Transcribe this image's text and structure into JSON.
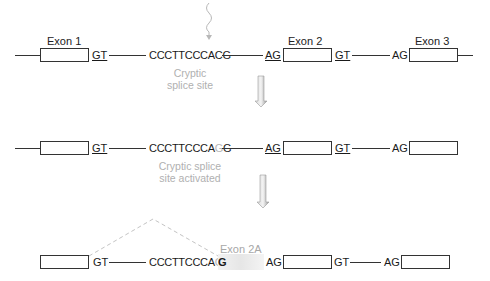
{
  "row1": {
    "exon_labels": [
      "Exon 1",
      "Exon 2",
      "Exon 3"
    ],
    "gt1": "GT",
    "sequence": "CCCTTCCCACG",
    "ag2": "AG",
    "gt2": "GT",
    "ag3": "AG",
    "annotation_line1": "Cryptic",
    "annotation_line2": "splice site"
  },
  "row2": {
    "gt1": "GT",
    "sequence_prefix": "CCCTTCCCA",
    "sequence_mutated_base": "G",
    "sequence_suffix": "G",
    "ag2": "AG",
    "gt2": "GT",
    "ag3": "AG",
    "annotation_line1": "Cryptic splice",
    "annotation_line2": "site activated"
  },
  "row3": {
    "gt1": "GT",
    "sequence_prefix": "CCCTTCCCA",
    "sequence_mutated_base": "G",
    "exon2a_start": "G",
    "exon2a_label": "Exon 2A",
    "ag2": "AG",
    "gt2": "GT",
    "ag3": "AG"
  },
  "colors": {
    "line": "#333333",
    "annotation": "#b0b0b0",
    "arrow_fill": "#a8a8a8",
    "exon2a_fill": "#ececec",
    "dashed": "#bdbdbd"
  }
}
